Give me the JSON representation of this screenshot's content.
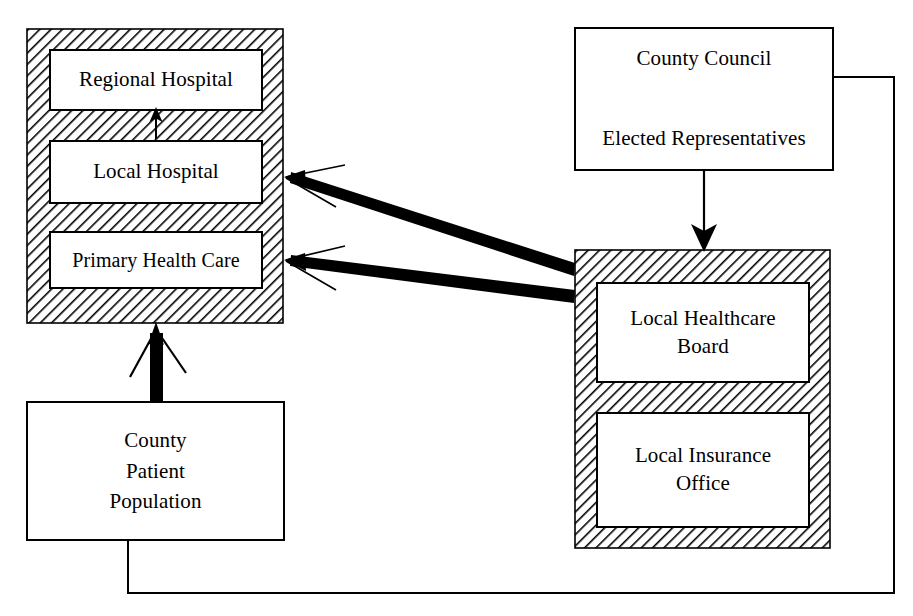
{
  "diagram": {
    "background_color": "#ffffff",
    "line_color": "#000000",
    "hatch_color": "#000000",
    "box_fill": "#ffffff",
    "groups": [
      {
        "id": "provider-group",
        "name": "provider-group",
        "style": "hatched-container",
        "x": 27,
        "y": 29,
        "width": 256,
        "height": 294,
        "nodes": [
          {
            "id": "regional-hospital",
            "label": "Regional Hospital",
            "x": 50,
            "y": 50,
            "width": 212,
            "height": 60
          },
          {
            "id": "local-hospital",
            "label": "Local Hospital",
            "x": 50,
            "y": 141,
            "width": 212,
            "height": 62
          },
          {
            "id": "primary-health-care",
            "label": "Primary Health Care",
            "x": 50,
            "y": 232,
            "width": 212,
            "height": 56
          }
        ]
      },
      {
        "id": "purchaser-group",
        "name": "purchaser-group",
        "style": "hatched-container",
        "x": 575,
        "y": 250,
        "width": 255,
        "height": 298,
        "nodes": [
          {
            "id": "local-healthcare-board",
            "label": "Local Healthcare\nBoard",
            "x": 597,
            "y": 283,
            "width": 212,
            "height": 99
          },
          {
            "id": "local-insurance-office",
            "label": "Local Insurance\nOffice",
            "x": 597,
            "y": 413,
            "width": 212,
            "height": 114
          }
        ]
      }
    ],
    "nodes": [
      {
        "id": "county-council",
        "label": "County Council\n\nElected Representatives",
        "x": 575,
        "y": 28,
        "width": 258,
        "height": 142,
        "style": "plain-box"
      },
      {
        "id": "county-patient-population",
        "label": "County\nPatient\nPopulation",
        "x": 27,
        "y": 402,
        "width": 257,
        "height": 138,
        "style": "plain-box"
      }
    ],
    "edges": [
      {
        "id": "edge-local-to-regional",
        "from": "local-hospital",
        "to": "regional-hospital",
        "style": "thin-arrow",
        "direction": "up"
      },
      {
        "id": "edge-board-to-local-hospital",
        "from": "local-healthcare-board",
        "to": "local-hospital",
        "style": "thick-arrow",
        "direction": "left"
      },
      {
        "id": "edge-board-to-primary-care",
        "from": "local-healthcare-board",
        "to": "primary-health-care",
        "style": "thick-arrow",
        "direction": "left"
      },
      {
        "id": "edge-council-to-purchaser",
        "from": "county-council",
        "to": "purchaser-group",
        "style": "thin-arrow",
        "direction": "down"
      },
      {
        "id": "edge-population-to-providers",
        "from": "county-patient-population",
        "to": "provider-group",
        "style": "thick-arrow",
        "direction": "up"
      },
      {
        "id": "edge-population-to-council",
        "from": "county-patient-population",
        "to": "county-council",
        "style": "plain-line",
        "direction": "none"
      }
    ]
  }
}
